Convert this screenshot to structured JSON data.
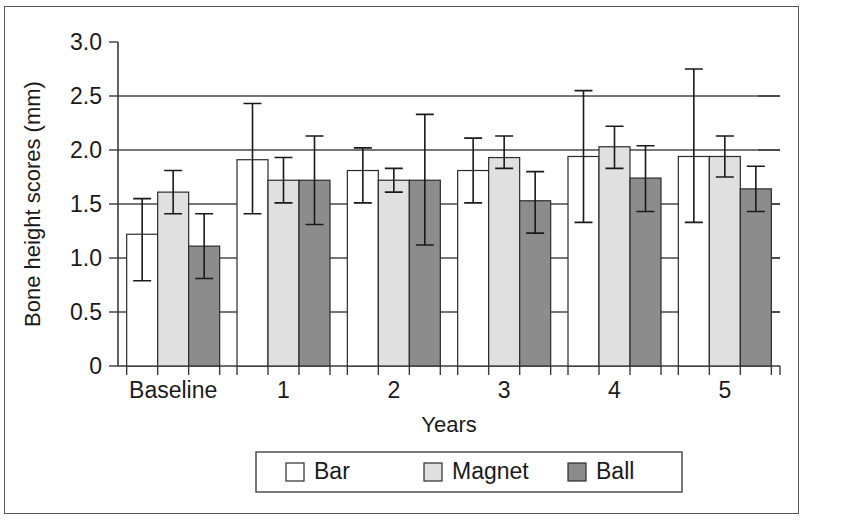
{
  "chart_data": {
    "type": "bar",
    "title": "",
    "xlabel": "Years",
    "ylabel": "Bone height scores (mm)",
    "categories": [
      "Baseline",
      "1",
      "2",
      "3",
      "4",
      "5"
    ],
    "ylim": [
      0,
      3.0
    ],
    "yticks": [
      0,
      0.5,
      1.0,
      1.5,
      2.0,
      2.5,
      3.0
    ],
    "ytick_labels": [
      "0",
      "0.5",
      "1.0",
      "1.5",
      "2.0",
      "2.5",
      "3.0"
    ],
    "grid": "horizontal",
    "legend_position": "bottom",
    "series": [
      {
        "name": "Bar",
        "color": "#ffffff",
        "values": [
          1.22,
          1.91,
          1.81,
          1.81,
          1.94,
          1.94
        ],
        "err_low": [
          0.79,
          1.41,
          1.51,
          1.51,
          1.33,
          1.33
        ],
        "err_high": [
          1.55,
          2.43,
          2.02,
          2.11,
          2.55,
          2.75
        ]
      },
      {
        "name": "Magnet",
        "color": "#e0e0e0",
        "values": [
          1.61,
          1.72,
          1.72,
          1.93,
          2.03,
          1.94
        ],
        "err_low": [
          1.41,
          1.51,
          1.61,
          1.83,
          1.83,
          1.75
        ],
        "err_high": [
          1.81,
          1.93,
          1.83,
          2.13,
          2.22,
          2.13
        ]
      },
      {
        "name": "Ball",
        "color": "#8c8c8c",
        "values": [
          1.11,
          1.72,
          1.72,
          1.53,
          1.74,
          1.64
        ],
        "err_low": [
          0.81,
          1.31,
          1.12,
          1.23,
          1.43,
          1.43
        ],
        "err_high": [
          1.41,
          2.13,
          2.33,
          1.8,
          2.04,
          1.85
        ]
      }
    ]
  },
  "legend": {
    "items": [
      {
        "label": "Bar",
        "color": "#ffffff"
      },
      {
        "label": "Magnet",
        "color": "#e0e0e0"
      },
      {
        "label": "Ball",
        "color": "#8c8c8c"
      }
    ]
  }
}
